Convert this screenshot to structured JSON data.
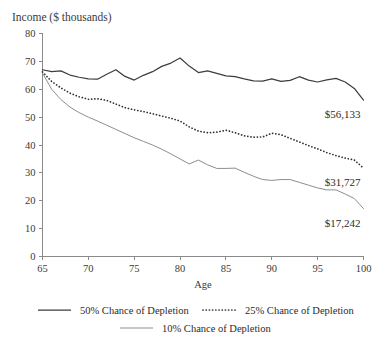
{
  "chart_data": {
    "type": "line",
    "title": "Income ($ thousands)",
    "xlabel": "Age",
    "ylabel": "",
    "xlim": [
      65,
      100
    ],
    "ylim": [
      0,
      80
    ],
    "xticks": [
      65,
      70,
      75,
      80,
      85,
      90,
      95,
      100
    ],
    "yticks": [
      0,
      10,
      20,
      30,
      40,
      50,
      60,
      70,
      80
    ],
    "grid": false,
    "legend_position": "bottom",
    "x": [
      65,
      66,
      67,
      68,
      69,
      70,
      71,
      72,
      73,
      74,
      75,
      76,
      77,
      78,
      79,
      80,
      81,
      82,
      83,
      84,
      85,
      86,
      87,
      88,
      89,
      90,
      91,
      92,
      93,
      94,
      95,
      96,
      97,
      98,
      99,
      100
    ],
    "series": [
      {
        "name": "50% Chance of Depletion",
        "style": "solid",
        "end_label": "$56,133",
        "end_value": 56.133,
        "values": [
          67.0,
          66.3,
          66.6,
          65.1,
          64.3,
          63.7,
          63.6,
          65.4,
          67.0,
          64.6,
          63.3,
          65.0,
          66.3,
          68.2,
          69.4,
          71.2,
          68.3,
          66.0,
          66.6,
          65.7,
          64.8,
          64.5,
          63.7,
          63.0,
          62.9,
          63.7,
          62.8,
          63.2,
          64.5,
          63.3,
          62.6,
          63.4,
          63.9,
          62.6,
          60.3,
          56.1
        ]
      },
      {
        "name": "25% Chance of Depletion",
        "style": "dotted",
        "end_label": "$31,727",
        "end_value": 31.727,
        "values": [
          66.2,
          62.8,
          60.5,
          58.6,
          57.3,
          56.4,
          56.6,
          56.0,
          54.7,
          53.4,
          52.6,
          52.0,
          51.2,
          50.4,
          49.6,
          48.6,
          46.5,
          45.0,
          44.4,
          44.6,
          45.3,
          44.4,
          43.3,
          42.8,
          42.9,
          44.2,
          43.7,
          42.4,
          41.1,
          39.8,
          38.6,
          37.3,
          36.2,
          35.3,
          34.6,
          31.7
        ]
      },
      {
        "name": "10% Chance of Depletion",
        "style": "thin-solid",
        "end_label": "$17,242",
        "end_value": 17.242,
        "values": [
          65.8,
          60.0,
          56.3,
          53.6,
          51.6,
          50.0,
          48.6,
          47.1,
          45.6,
          44.1,
          42.6,
          41.3,
          40.0,
          38.5,
          36.8,
          35.0,
          33.2,
          34.6,
          32.9,
          31.6,
          31.6,
          31.7,
          30.2,
          28.8,
          27.6,
          27.3,
          27.6,
          27.6,
          26.6,
          25.6,
          24.6,
          23.9,
          23.9,
          22.4,
          20.8,
          17.2
        ]
      }
    ]
  },
  "legend": {
    "items": [
      {
        "label": "50% Chance of Depletion",
        "style": "solid"
      },
      {
        "label": "25% Chance of Depletion",
        "style": "dotted"
      },
      {
        "label": "10% Chance of Depletion",
        "style": "thin-solid"
      }
    ]
  },
  "colors": {
    "series_50": "#3d3d3d",
    "series_25": "#2f2f2f",
    "series_10": "#8d8d8d",
    "axis": "#8a8a8a",
    "text": "#2b2b2b",
    "background": "#ffffff"
  }
}
